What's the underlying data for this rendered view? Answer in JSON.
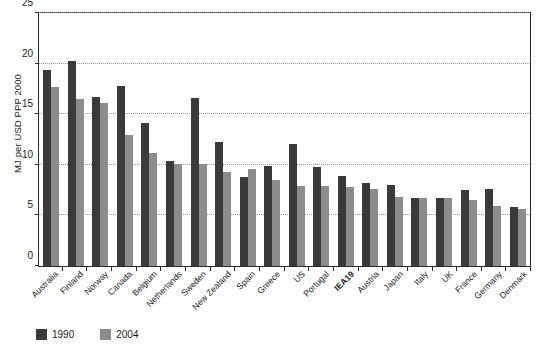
{
  "chart_data": {
    "type": "bar",
    "title": "",
    "subtitle": "",
    "xlabel": "",
    "ylabel": "MJ per USD PPP 2000",
    "ylim": [
      0,
      25
    ],
    "yticks": [
      0,
      5,
      10,
      15,
      20,
      25
    ],
    "ytick_labels": [
      "0",
      "5",
      "10",
      "15",
      "20",
      "25"
    ],
    "grid": true,
    "grid_axis": "y",
    "legend_position": "bottom-left",
    "highlight_category": "IEA19",
    "categories": [
      "Australia",
      "Finland",
      "Norway",
      "Canada",
      "Belgium",
      "Netherlands",
      "Sweden",
      "New Zealand",
      "Spain",
      "Greece",
      "US",
      "Portugal",
      "IEA19",
      "Austria",
      "Japan",
      "Italy",
      "UK",
      "France",
      "Germany",
      "Denmark"
    ],
    "series": [
      {
        "name": "1990",
        "color": "#3a3a3a",
        "values": [
          19.4,
          20.3,
          16.7,
          17.8,
          14.1,
          10.4,
          16.6,
          12.3,
          8.8,
          9.9,
          12.1,
          9.8,
          8.9,
          8.2,
          8.0,
          6.7,
          6.7,
          7.5,
          7.6,
          5.8
        ]
      },
      {
        "name": "2004",
        "color": "#8c8c8c",
        "values": [
          17.7,
          16.5,
          16.1,
          12.9,
          11.2,
          10.1,
          10.1,
          9.3,
          9.6,
          8.5,
          7.9,
          7.9,
          7.8,
          7.6,
          6.8,
          6.7,
          6.7,
          6.5,
          5.9,
          5.6
        ]
      }
    ]
  },
  "legend": {
    "items": [
      {
        "label": "1990",
        "color": "#3a3a3a"
      },
      {
        "label": "2004",
        "color": "#8c8c8c"
      }
    ]
  },
  "axes": {
    "y_title": "MJ per USD PPP 2000"
  }
}
